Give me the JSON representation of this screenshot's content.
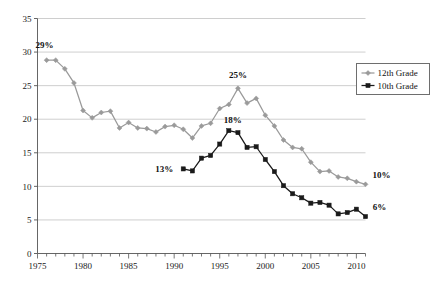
{
  "chart_data": {
    "type": "line",
    "title": "",
    "subtitle": "",
    "xlabel": "",
    "ylabel": "",
    "xlim": [
      1975,
      2011
    ],
    "ylim": [
      0,
      35
    ],
    "ytick_step": 5,
    "xtick_step": 5,
    "grid": "horizontal",
    "legend_position": "top-right",
    "yticks": [
      "0",
      "5",
      "10",
      "15",
      "20",
      "25",
      "30",
      "35"
    ],
    "ytick_values": [
      0,
      5,
      10,
      15,
      20,
      25,
      30,
      35
    ],
    "xticks": [
      "1975",
      "1980",
      "1985",
      "1990",
      "1995",
      "2000",
      "2005",
      "2010"
    ],
    "xtick_values": [
      1975,
      1980,
      1985,
      1990,
      1995,
      2000,
      2005,
      2010
    ],
    "series": [
      {
        "name": "12th Grade",
        "color": "#9a9a9a",
        "marker": "diamond",
        "x": [
          1976,
          1977,
          1978,
          1979,
          1980,
          1981,
          1982,
          1983,
          1984,
          1985,
          1986,
          1987,
          1988,
          1989,
          1990,
          1991,
          1992,
          1993,
          1994,
          1995,
          1996,
          1997,
          1998,
          1999,
          2000,
          2001,
          2002,
          2003,
          2004,
          2005,
          2006,
          2007,
          2008,
          2009,
          2010,
          2011
        ],
        "values": [
          28.8,
          28.8,
          27.5,
          25.4,
          21.3,
          20.2,
          21.0,
          21.2,
          18.7,
          19.5,
          18.7,
          18.6,
          18.1,
          18.9,
          19.1,
          18.5,
          17.2,
          19.0,
          19.4,
          21.6,
          22.2,
          24.6,
          22.4,
          23.1,
          20.6,
          19.0,
          16.9,
          15.8,
          15.6,
          13.6,
          12.2,
          12.3,
          11.4,
          11.2,
          10.7,
          10.3
        ]
      },
      {
        "name": "10th Grade",
        "color": "#1a1a1a",
        "marker": "square",
        "x": [
          1991,
          1992,
          1993,
          1994,
          1995,
          1996,
          1997,
          1998,
          1999,
          2000,
          2001,
          2002,
          2003,
          2004,
          2005,
          2006,
          2007,
          2008,
          2009,
          2010,
          2011
        ],
        "values": [
          12.6,
          12.3,
          14.2,
          14.6,
          16.3,
          18.3,
          18.0,
          15.8,
          15.9,
          14.0,
          12.2,
          10.1,
          8.9,
          8.3,
          7.5,
          7.6,
          7.2,
          5.9,
          6.1,
          6.6,
          5.5
        ]
      }
    ],
    "annotations": [
      {
        "text": "29%",
        "series": "12th Grade",
        "x": 1976,
        "y": 28.8,
        "dx": -2,
        "dy": -12
      },
      {
        "text": "25%",
        "series": "12th Grade",
        "x": 1997,
        "y": 24.6,
        "dx": 0,
        "dy": -10
      },
      {
        "text": "10%",
        "series": "12th Grade",
        "x": 2011,
        "y": 10.3,
        "dx": 16,
        "dy": -6
      },
      {
        "text": "13%",
        "series": "10th Grade",
        "x": 1991,
        "y": 12.6,
        "dx": -19,
        "dy": 3
      },
      {
        "text": "18%",
        "series": "10th Grade",
        "x": 1996,
        "y": 18.3,
        "dx": 4,
        "dy": -8
      },
      {
        "text": "6%",
        "series": "10th Grade",
        "x": 2011,
        "y": 5.5,
        "dx": 14,
        "dy": -7
      }
    ]
  },
  "legend": {
    "items": [
      {
        "label": "12th Grade",
        "color": "#9a9a9a",
        "marker": "diamond"
      },
      {
        "label": "10th Grade",
        "color": "#1a1a1a",
        "marker": "square"
      }
    ]
  }
}
